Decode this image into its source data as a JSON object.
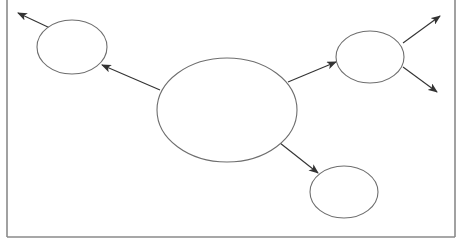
{
  "diagram": {
    "type": "node-arrow-diagram",
    "width": 462,
    "height": 245,
    "colors": {
      "background": "#ffffff",
      "frame": "#8a8a8a",
      "stroke": "#6e6e6e",
      "arrow": "#333333"
    },
    "frame": {
      "left": 7,
      "right": 455,
      "top": 0,
      "bottom": 237,
      "sides": [
        "left",
        "right",
        "bottom"
      ]
    },
    "nodes": [
      {
        "id": "center",
        "cx": 227,
        "cy": 110,
        "rx": 70,
        "ry": 52
      },
      {
        "id": "top-left",
        "cx": 72,
        "cy": 47,
        "rx": 35,
        "ry": 27
      },
      {
        "id": "right",
        "cx": 370,
        "cy": 57,
        "rx": 34,
        "ry": 26
      },
      {
        "id": "bottom-right",
        "cx": 344,
        "cy": 192,
        "rx": 34,
        "ry": 26
      }
    ],
    "edges": [
      {
        "id": "center-to-top-left",
        "from": "center",
        "to": "top-left",
        "x1": 160,
        "y1": 90,
        "x2": 102,
        "y2": 65
      },
      {
        "id": "top-left-out",
        "from": "top-left",
        "to": "outside",
        "x1": 50,
        "y1": 28,
        "x2": 18,
        "y2": 13
      },
      {
        "id": "center-to-right",
        "from": "center",
        "to": "right",
        "x1": 288,
        "y1": 82,
        "x2": 336,
        "y2": 62
      },
      {
        "id": "right-out-up",
        "from": "right",
        "to": "outside",
        "x1": 403,
        "y1": 43,
        "x2": 440,
        "y2": 16
      },
      {
        "id": "right-out-down",
        "from": "right",
        "to": "outside",
        "x1": 403,
        "y1": 67,
        "x2": 437,
        "y2": 92
      },
      {
        "id": "center-to-bottom-right",
        "from": "center",
        "to": "bottom-right",
        "x1": 280,
        "y1": 143,
        "x2": 318,
        "y2": 173
      }
    ]
  }
}
